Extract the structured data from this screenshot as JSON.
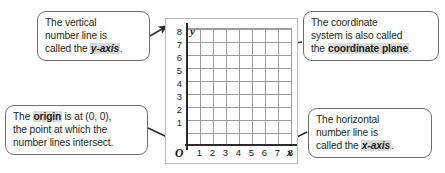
{
  "graph": {
    "y_axis_name": "y",
    "x_axis_name": "x",
    "origin_label": "O",
    "y_ticks": [
      "8",
      "7",
      "6",
      "5",
      "4",
      "3",
      "2",
      "1"
    ],
    "x_ticks": [
      "1",
      "2",
      "3",
      "4",
      "5",
      "6",
      "7",
      "8"
    ],
    "grid_columns": 8,
    "grid_rows": 9,
    "grid_line_color": "#9c9c9c",
    "axis_line_color": "#2b2b2b",
    "panel_border_color": "#b9b9b9"
  },
  "callouts": {
    "y_axis": {
      "line1": "The vertical",
      "line2": "number line is",
      "line3_prefix": "called the ",
      "line3_term": "y-axis",
      "line3_suffix": "."
    },
    "coordinate_plane": {
      "line1": "The coordinate",
      "line2": "system is also called",
      "line3_prefix": "the ",
      "line3_term": "coordinate plane",
      "line3_suffix": "."
    },
    "origin": {
      "line1_prefix": "The ",
      "line1_term": "origin",
      "line1_suffix": " is at (0, 0),",
      "line2": "the point at which the",
      "line3": "number lines intersect."
    },
    "x_axis": {
      "line1": "The horizontal",
      "line2": "number line is",
      "line3_prefix": "called the ",
      "line3_term": "x-axis",
      "line3_suffix": "."
    }
  },
  "colors": {
    "highlight": "#d9d9d9",
    "callout_border": "#6e6e6e",
    "text": "#231f20"
  }
}
